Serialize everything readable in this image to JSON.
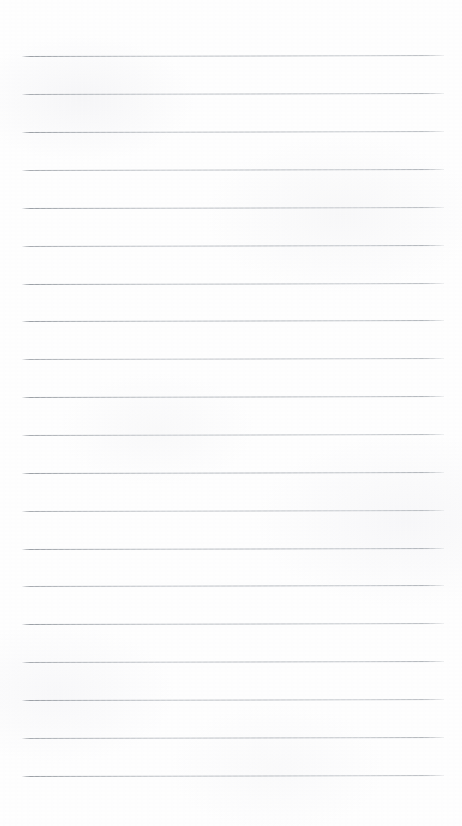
{
  "document": {
    "type": "ruled-notebook-paper-scan",
    "title": "Blank Lined Paper",
    "page_width_px": 462,
    "page_height_px": 826,
    "has_text": false,
    "has_handwriting": false,
    "has_margin_rule": false,
    "has_punch_holes": false,
    "has_header": false,
    "has_footer": false,
    "page_number_visible": "",
    "background_color": "#fefefe",
    "paper_tone": "#fdfdfd"
  },
  "ruling": {
    "style": "wide-ruled",
    "line_color": "#aab0b6",
    "line_thickness_px": 1,
    "line_count": 20,
    "first_line_y_px": 56,
    "line_spacing_px": 37.9,
    "last_line_y_px": 776,
    "line_start_x_px": 22,
    "line_end_x_px": 444,
    "line_length_px": 422,
    "skew_degrees": -0.13,
    "margins": {
      "top_px": 56,
      "left_px": 22,
      "right_px": 18,
      "bottom_px": 50
    },
    "line_y_positions_px": [
      56,
      94,
      132,
      170,
      208,
      246,
      284,
      321,
      359,
      397,
      435,
      473,
      511,
      549,
      586,
      624,
      662,
      700,
      738,
      776
    ]
  }
}
